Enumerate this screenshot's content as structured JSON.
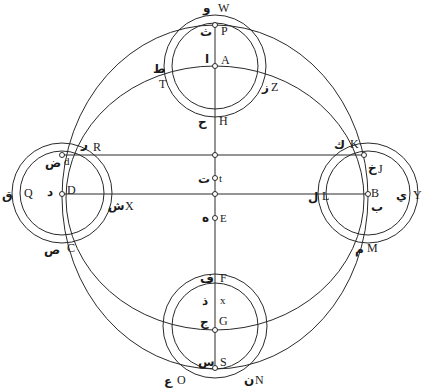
{
  "diagram": {
    "labels": {
      "W": {
        "latin": "W",
        "arabic": "و"
      },
      "P": {
        "latin": "P",
        "arabic": "ث"
      },
      "A": {
        "latin": "A",
        "arabic": "ا"
      },
      "T": {
        "latin": "T",
        "arabic": "ط"
      },
      "Z": {
        "latin": "Z",
        "arabic": "ز"
      },
      "H": {
        "latin": "H",
        "arabic": "ح"
      },
      "R": {
        "latin": "R",
        "arabic": "ر"
      },
      "K": {
        "latin": "K",
        "arabic": "ك"
      },
      "d": {
        "latin": "d",
        "arabic": "ض"
      },
      "J": {
        "latin": "J",
        "arabic": "خ"
      },
      "t": {
        "latin": "t",
        "arabic": "ت"
      },
      "Q": {
        "latin": "Q",
        "arabic": "ق"
      },
      "D": {
        "latin": "D",
        "arabic": "د"
      },
      "X": {
        "latin": "X",
        "arabic": "ش"
      },
      "L": {
        "latin": "L",
        "arabic": "ل"
      },
      "B": {
        "latin": "B",
        "arabic": "ب"
      },
      "Y": {
        "latin": "Y",
        "arabic": "ي"
      },
      "E": {
        "latin": "E",
        "arabic": "ه"
      },
      "C": {
        "latin": "C",
        "arabic": "ص"
      },
      "M": {
        "latin": "M",
        "arabic": "م"
      },
      "F": {
        "latin": "F",
        "arabic": "ف"
      },
      "x": {
        "latin": "x",
        "arabic": "ذ"
      },
      "G": {
        "latin": "G",
        "arabic": "ج"
      },
      "S": {
        "latin": "S",
        "arabic": "س"
      },
      "O": {
        "latin": "O",
        "arabic": "ع"
      },
      "N": {
        "latin": "N",
        "arabic": "ن"
      }
    },
    "colors": {
      "stroke": "#2a2a2a",
      "background": "#ffffff"
    }
  }
}
